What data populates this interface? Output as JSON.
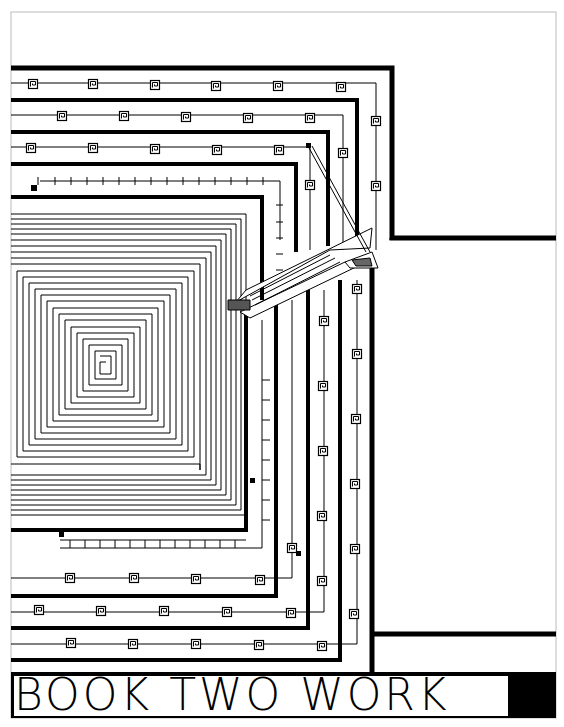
{
  "page": {
    "title": "BOOK TWO WORK",
    "colors": {
      "ink": "#000000",
      "paper": "#ffffff",
      "border": "#bbbbbb"
    }
  },
  "illustration": {
    "description": "Geometric greek-key meander border with concentric square spiral and diagonal perspective arrows",
    "motif_icon": "greek-key-square-icon"
  }
}
